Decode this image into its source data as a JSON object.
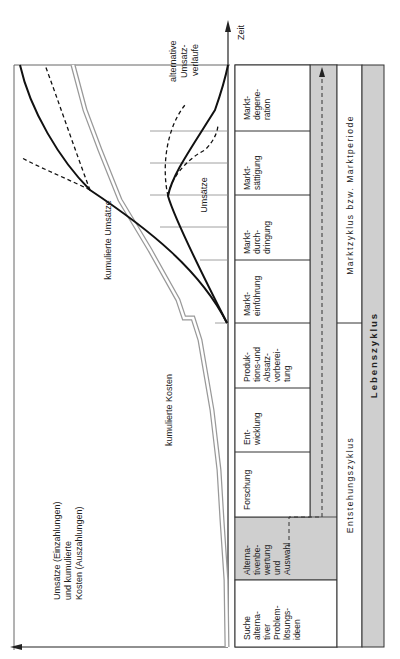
{
  "axes": {
    "y_label_lines": [
      "Umsätze (Einzahlungen)",
      "und kumulierte",
      "Kosten (Auszahlungen)"
    ],
    "x_label": "Zeit"
  },
  "curves": {
    "cum_revenue": "kumulierte Umsätze",
    "cum_costs": "kumulierte Kosten",
    "revenue": "Umsätze",
    "alt_revenue_lines": [
      "alternative",
      "Umsatz-",
      "verläufe"
    ]
  },
  "phases": [
    {
      "lines": [
        "Suche",
        "alterna-",
        "tiver",
        "Problem-",
        "lösungs-",
        "ideen"
      ],
      "shaded": false
    },
    {
      "lines": [
        "Alterna-",
        "tivenbe-",
        "wertung",
        "und",
        "Auswahl"
      ],
      "shaded": true
    },
    {
      "lines": [
        "Forschung"
      ],
      "shaded": false
    },
    {
      "lines": [
        "Ent-",
        "wicklung"
      ],
      "shaded": false
    },
    {
      "lines": [
        "Produk-",
        "tions-und",
        "Absatz-",
        "vorberei-",
        "tung"
      ],
      "shaded": false
    },
    {
      "lines": [
        "Markt-",
        "einführung"
      ],
      "shaded": false
    },
    {
      "lines": [
        "Markt-",
        "durch-",
        "dringung"
      ],
      "shaded": false
    },
    {
      "lines": [
        "Markt-",
        "sättigung"
      ],
      "shaded": false
    },
    {
      "lines": [
        "Markt-",
        "degene-",
        "ration"
      ],
      "shaded": false
    }
  ],
  "cycles": {
    "origin": "Entstehungszyklus",
    "market": "Marktzyklus bzw. Marktperiode",
    "life": "Lebenszyklus"
  },
  "colors": {
    "line": "#1a1a1a",
    "shade": "#cfcfcf",
    "frame": "#555555"
  }
}
